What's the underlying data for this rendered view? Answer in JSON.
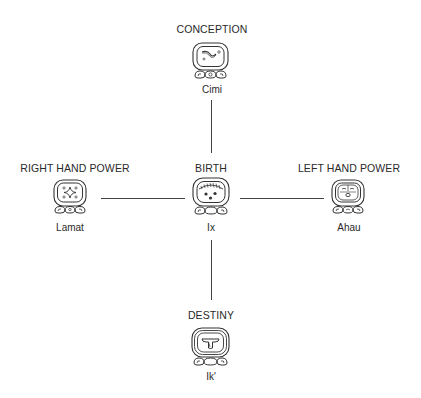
{
  "diagram": {
    "center": {
      "heading": "BIRTH",
      "glyph_name": "Ix",
      "glyph_icon": "ix-day-sign-icon"
    },
    "top": {
      "heading": "CONCEPTION",
      "glyph_name": "Cimi",
      "glyph_icon": "cimi-day-sign-icon"
    },
    "left": {
      "heading": "RIGHT HAND POWER",
      "glyph_name": "Lamat",
      "glyph_icon": "lamat-day-sign-icon"
    },
    "right": {
      "heading": "LEFT HAND POWER",
      "glyph_name": "Ahau",
      "glyph_icon": "ahau-day-sign-icon"
    },
    "bottom": {
      "heading": "DESTINY",
      "glyph_name": "Ik'",
      "glyph_icon": "ik-day-sign-icon"
    },
    "connections": [
      [
        "CONCEPTION",
        "BIRTH"
      ],
      [
        "RIGHT HAND POWER",
        "BIRTH"
      ],
      [
        "BIRTH",
        "LEFT HAND POWER"
      ],
      [
        "BIRTH",
        "DESTINY"
      ]
    ]
  },
  "colors": {
    "ink": "#2a2a2a",
    "background": "#ffffff"
  }
}
